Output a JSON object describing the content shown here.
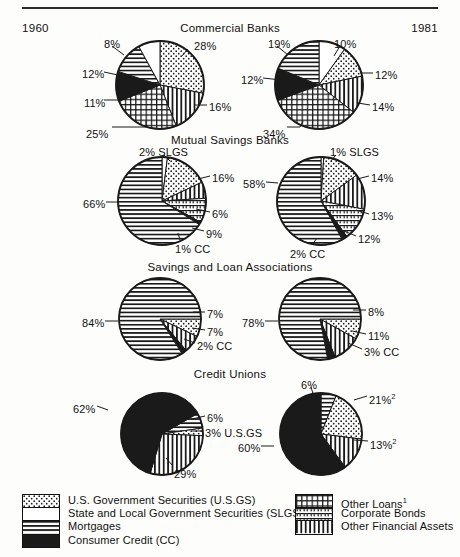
{
  "header": {
    "year_left": "1960",
    "year_right": "1981"
  },
  "sections": [
    {
      "title": "Commercial Banks",
      "title_top": 22,
      "pie_top": 36
    },
    {
      "title": "Mutual Savings Banks",
      "title_top": 134,
      "pie_top": 152
    },
    {
      "title": "Savings and Loan Associations",
      "title_top": 261,
      "pie_top": 280
    },
    {
      "title": "Credit Unions",
      "title_top": 368,
      "pie_top": 386
    }
  ],
  "legend": {
    "left_items": [
      {
        "label": "U.S. Government Securities (U.S.GS)",
        "pattern": "dots"
      },
      {
        "label": "State and Local Government Securities (SLGS)",
        "pattern": "white"
      },
      {
        "label": "Mortgages",
        "pattern": "horizontal"
      },
      {
        "label": "Consumer Credit (CC)",
        "pattern": "black"
      }
    ],
    "right_items": [
      {
        "label": "Other Loans",
        "sup": "1",
        "pattern": "grid"
      },
      {
        "label": "Corporate Bonds",
        "sup": "",
        "pattern": "brick"
      },
      {
        "label": "Other Financial Assets",
        "sup": "",
        "pattern": "vertical"
      }
    ]
  },
  "chart_data": [
    {
      "type": "pie",
      "title": "Commercial Banks",
      "year": "1960",
      "cx": 160,
      "cy": 85,
      "r": 44,
      "start_angle": 0,
      "slices": [
        {
          "label": "28%",
          "value": 28,
          "pattern": "dots",
          "lx": 194,
          "ly": 40,
          "leader": "M 188 49 L 181 57"
        },
        {
          "label": "16%",
          "value": 16,
          "pattern": "vertical",
          "lx": 209,
          "ly": 101,
          "leader": "M 207 105 L 195 105"
        },
        {
          "label": "25%",
          "value": 25,
          "pattern": "grid",
          "lx": 86,
          "ly": 128,
          "leader": "M 112 127 L 146 127 L 146 121"
        },
        {
          "label": "11%",
          "value": 11,
          "pattern": "black",
          "lx": 84,
          "ly": 97,
          "leader": "M 104 100 L 118 100"
        },
        {
          "label": "12%",
          "value": 12,
          "pattern": "horizontal",
          "lx": 82,
          "ly": 68,
          "leader": "M 104 72 L 118 75"
        },
        {
          "label": "8%",
          "value": 8,
          "pattern": "white",
          "lx": 104,
          "ly": 38,
          "leader": "M 112 46 L 124 55"
        }
      ]
    },
    {
      "type": "pie",
      "title": "Commercial Banks",
      "year": "1981",
      "cx": 319,
      "cy": 85,
      "r": 44,
      "start_angle": 0,
      "slices": [
        {
          "label": "10%",
          "value": 10,
          "pattern": "white",
          "lx": 334,
          "ly": 38,
          "leader": "M 340 46 L 334 56"
        },
        {
          "label": "12%",
          "value": 12,
          "pattern": "dots",
          "lx": 375,
          "ly": 69,
          "leader": "M 373 73 L 361 73"
        },
        {
          "label": "14%",
          "value": 14,
          "pattern": "vertical",
          "lx": 372,
          "ly": 101,
          "leader": "M 370 105 L 358 103"
        },
        {
          "label": "34%",
          "value": 34,
          "pattern": "grid",
          "lx": 263,
          "ly": 128,
          "leader": "M 287 127 L 300 127 L 303 121"
        },
        {
          "label": "12%",
          "value": 12,
          "pattern": "black",
          "lx": 241,
          "ly": 74,
          "leader": "M 263 78 L 281 80"
        },
        {
          "label": "19%",
          "value": 19,
          "pattern": "horizontal",
          "lx": 268,
          "ly": 38,
          "leader": "M 277 46 L 288 55"
        }
      ]
    },
    {
      "type": "pie",
      "title": "Mutual Savings Banks",
      "year": "1960",
      "cx": 162,
      "cy": 201,
      "r": 44,
      "start_angle": 0,
      "slices": [
        {
          "label": "2% SLGS",
          "value": 2,
          "pattern": "white",
          "lx": 139,
          "ly": 146,
          "leader": "M 164 155 L 170 161"
        },
        {
          "label": "16%",
          "value": 16,
          "pattern": "dots",
          "lx": 212,
          "ly": 172,
          "leader": "M 210 176 L 198 179"
        },
        {
          "label": "6%",
          "value": 6,
          "pattern": "vertical",
          "lx": 212,
          "ly": 208,
          "leader": "M 210 212 L 196 209"
        },
        {
          "label": "9%",
          "value": 9,
          "pattern": "brick",
          "lx": 206,
          "ly": 228,
          "leader": "M 204 231 L 192 228"
        },
        {
          "label": "1% CC",
          "value": 1,
          "pattern": "black",
          "lx": 175,
          "ly": 243,
          "leader": "M 180 240 L 178 233"
        },
        {
          "label": "66%",
          "value": 66,
          "pattern": "horizontal",
          "lx": 83,
          "ly": 198,
          "leader": "M 106 202 L 118 202"
        }
      ]
    },
    {
      "type": "pie",
      "title": "Mutual Savings Banks",
      "year": "1981",
      "cx": 321,
      "cy": 201,
      "r": 44,
      "start_angle": 0,
      "slices": [
        {
          "label": "1% SLGS",
          "value": 1,
          "pattern": "white",
          "lx": 330,
          "ly": 146,
          "leader": "M 336 155 L 331 161"
        },
        {
          "label": "14%",
          "value": 14,
          "pattern": "dots",
          "lx": 371,
          "ly": 172,
          "leader": "M 369 176 L 357 179"
        },
        {
          "label": "13%",
          "value": 13,
          "pattern": "vertical",
          "lx": 371,
          "ly": 210,
          "leader": "M 369 214 L 356 210"
        },
        {
          "label": "12%",
          "value": 12,
          "pattern": "brick",
          "lx": 358,
          "ly": 233,
          "leader": "M 356 236 L 344 231"
        },
        {
          "label": "2% CC",
          "value": 2,
          "pattern": "black",
          "lx": 290,
          "ly": 248,
          "leader": "M 312 245 L 317 238"
        },
        {
          "label": "58%",
          "value": 58,
          "pattern": "horizontal",
          "lx": 243,
          "ly": 178,
          "leader": "M 266 182 L 278 183"
        }
      ]
    },
    {
      "type": "pie",
      "title": "Savings and Loan Associations",
      "year": "1960",
      "cx": 160,
      "cy": 319,
      "r": 41,
      "start_angle": 90,
      "slices": [
        {
          "label": "7%",
          "value": 7,
          "pattern": "dots",
          "lx": 207,
          "ly": 308,
          "leader": "M 205 312 L 193 312"
        },
        {
          "label": "7%",
          "value": 7,
          "pattern": "vertical",
          "lx": 207,
          "ly": 326,
          "leader": "M 205 330 L 192 328"
        },
        {
          "label": "2% CC",
          "value": 2,
          "pattern": "black",
          "lx": 197,
          "ly": 340,
          "leader": "M 195 343 L 184 339"
        },
        {
          "label": "84%",
          "value": 84,
          "pattern": "horizontal",
          "lx": 82,
          "ly": 317,
          "leader": "M 105 321 L 118 321"
        }
      ]
    },
    {
      "type": "pie",
      "title": "Savings and Loan Associations",
      "year": "1981",
      "cx": 320,
      "cy": 319,
      "r": 41,
      "start_angle": 90,
      "slices": [
        {
          "label": "8%",
          "value": 8,
          "pattern": "dots",
          "lx": 368,
          "ly": 306,
          "leader": "M 366 310 L 353 310"
        },
        {
          "label": "11%",
          "value": 11,
          "pattern": "vertical",
          "lx": 368,
          "ly": 330,
          "leader": "M 366 334 L 352 331"
        },
        {
          "label": "3% CC",
          "value": 3,
          "pattern": "black",
          "lx": 364,
          "ly": 346,
          "leader": "M 362 349 L 348 343"
        },
        {
          "label": "78%",
          "value": 78,
          "pattern": "horizontal",
          "lx": 242,
          "ly": 317,
          "leader": "M 265 321 L 278 321"
        }
      ]
    },
    {
      "type": "pie",
      "title": "Credit Unions",
      "year": "1960",
      "cx": 162,
      "cy": 434,
      "r": 41,
      "start_angle": 60,
      "slices": [
        {
          "label": "6%",
          "value": 6,
          "pattern": "horizontal",
          "lx": 207,
          "ly": 412,
          "leader": "M 205 416 L 192 419"
        },
        {
          "label": "3% U.S.GS",
          "value": 3,
          "pattern": "dots",
          "lx": 205,
          "ly": 427,
          "leader": "M 203 431 L 192 431"
        },
        {
          "label": "29%",
          "value": 29,
          "pattern": "vertical",
          "lx": 174,
          "ly": 468,
          "leader": "M 172 465 L 166 458"
        },
        {
          "label": "62%",
          "value": 62,
          "pattern": "black",
          "lx": 73,
          "ly": 403,
          "leader": "M 97 406 L 108 410"
        }
      ]
    },
    {
      "type": "pie",
      "title": "Credit Unions",
      "year": "1981",
      "cx": 321,
      "cy": 434,
      "r": 41,
      "start_angle": 0,
      "slices": [
        {
          "label": "6%",
          "value": 6,
          "pattern": "horizontal",
          "lx": 301,
          "ly": 379,
          "leader": "M 311 387 L 314 397"
        },
        {
          "label": "21%",
          "sup": "2",
          "value": 21,
          "pattern": "dots",
          "lx": 369,
          "ly": 392,
          "leader": "M 367 396 L 354 400"
        },
        {
          "label": "13%",
          "sup": "2",
          "value": 13,
          "pattern": "vertical",
          "lx": 370,
          "ly": 437,
          "leader": "M 368 441 L 354 440"
        },
        {
          "label": "60%",
          "value": 60,
          "pattern": "black",
          "lx": 238,
          "ly": 442,
          "leader": "M 261 446 L 274 446"
        }
      ]
    }
  ]
}
